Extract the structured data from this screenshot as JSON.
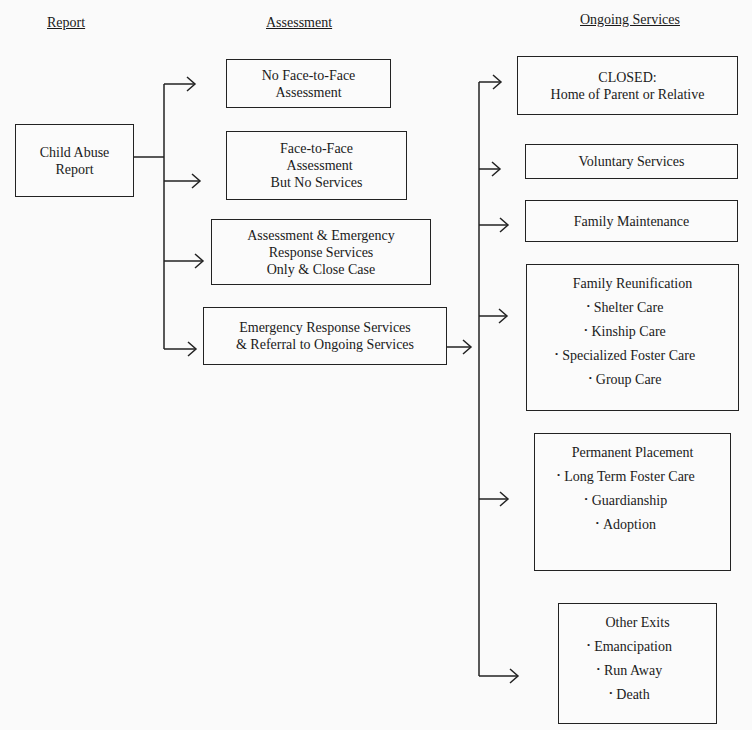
{
  "headers": {
    "report": "Report",
    "assessment": "Assessment",
    "ongoing": "Ongoing Services"
  },
  "report_box": {
    "text": "Child Abuse\nReport"
  },
  "assessment_boxes": [
    {
      "text": "No Face-to-Face\nAssessment"
    },
    {
      "text": "Face-to-Face\n  Assessment\nBut No Services"
    },
    {
      "text": "Assessment & Emergency\nResponse Services\nOnly & Close Case"
    },
    {
      "text": "Emergency Response Services\n& Referral to Ongoing Services"
    }
  ],
  "ongoing_boxes": [
    {
      "text": "CLOSED:\nHome of Parent or Relative"
    },
    {
      "text": "Voluntary Services"
    },
    {
      "text": "Family Maintenance"
    },
    {
      "title": "Family Reunification",
      "items": [
        "Shelter Care",
        "Kinship Care",
        "Specialized Foster Care",
        "Group Care"
      ]
    },
    {
      "title": "Permanent Placement",
      "items": [
        "Long Term Foster Care",
        "Guardianship",
        "Adoption"
      ]
    },
    {
      "title": "Other Exits",
      "items": [
        "Emancipation",
        "Run Away",
        "Death"
      ]
    }
  ],
  "bullet": "•",
  "colors": {
    "line": "#222222",
    "background": "#fafafa"
  }
}
